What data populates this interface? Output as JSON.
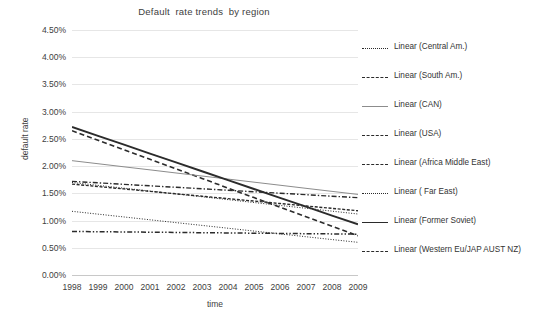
{
  "chart_data": {
    "type": "line",
    "title": "Default  rate trends  by region",
    "xlabel": "time",
    "ylabel": "default rate",
    "grid": true,
    "legend_position": "right",
    "x": [
      1998,
      1999,
      2000,
      2001,
      2002,
      2003,
      2004,
      2005,
      2006,
      2007,
      2008,
      2009
    ],
    "categories": [
      "1998",
      "1999",
      "2000",
      "2001",
      "2002",
      "2003",
      "2004",
      "2005",
      "2006",
      "2007",
      "2008",
      "2009"
    ],
    "ylim": [
      0.0,
      4.5
    ],
    "ytick_values": [
      0.0,
      0.5,
      1.0,
      1.5,
      2.0,
      2.5,
      3.0,
      3.5,
      4.0,
      4.5
    ],
    "ytick_labels": [
      "0.00%",
      "0.50%",
      "1.00%",
      "1.50%",
      "2.00%",
      "2.50%",
      "3.00%",
      "3.50%",
      "4.00%",
      "4.50%"
    ],
    "series": [
      {
        "name": "Linear (Central Am.)",
        "region": "Central Am.",
        "dash": "fine-dotted",
        "width": 1,
        "start": 1.7,
        "end": 1.12,
        "values": [
          1.7,
          1.647,
          1.595,
          1.542,
          1.489,
          1.437,
          1.384,
          1.331,
          1.278,
          1.226,
          1.173,
          1.12
        ]
      },
      {
        "name": "Linear (South Am.)",
        "region": "South Am.",
        "dash": "long-dash",
        "width": 1.6,
        "start": 2.65,
        "end": 0.72,
        "values": [
          2.65,
          2.475,
          2.299,
          2.124,
          1.948,
          1.773,
          1.597,
          1.422,
          1.246,
          1.071,
          0.895,
          0.72
        ]
      },
      {
        "name": "Linear (CAN)",
        "region": "CAN",
        "dash": "light-solid",
        "width": 1,
        "start": 2.1,
        "end": 1.48,
        "values": [
          2.1,
          2.044,
          1.987,
          1.931,
          1.874,
          1.818,
          1.762,
          1.705,
          1.649,
          1.592,
          1.536,
          1.48
        ]
      },
      {
        "name": "Linear (USA)",
        "region": "USA",
        "dash": "dash-dot",
        "width": 1.4,
        "start": 1.72,
        "end": 1.42,
        "values": [
          1.72,
          1.693,
          1.665,
          1.638,
          1.611,
          1.584,
          1.556,
          1.529,
          1.502,
          1.475,
          1.447,
          1.42
        ]
      },
      {
        "name": "Linear (Africa Middle East)",
        "region": "Africa Middle East",
        "dash": "dense-dash",
        "width": 1.4,
        "start": 1.67,
        "end": 1.18,
        "values": [
          1.67,
          1.625,
          1.581,
          1.536,
          1.491,
          1.447,
          1.402,
          1.358,
          1.313,
          1.268,
          1.224,
          1.18
        ]
      },
      {
        "name": "Linear ( Far East)",
        "region": " Far East",
        "dash": "fine-dotted",
        "width": 1,
        "start": 1.17,
        "end": 0.6,
        "values": [
          1.17,
          1.118,
          1.066,
          1.014,
          0.962,
          0.911,
          0.859,
          0.807,
          0.755,
          0.703,
          0.651,
          0.6
        ]
      },
      {
        "name": "Linear (Former Soviet)",
        "region": "Former Soviet",
        "dash": "solid",
        "width": 1.9,
        "start": 2.72,
        "end": 0.93,
        "values": [
          2.72,
          2.557,
          2.394,
          2.231,
          2.069,
          1.906,
          1.743,
          1.58,
          1.418,
          1.255,
          1.092,
          0.93
        ]
      },
      {
        "name": "Linear (Western Eu/JAP AUST NZ)",
        "region": "Western Eu/JAP AUST NZ",
        "dash": "dash-dot-dot",
        "width": 1.5,
        "start": 0.8,
        "end": 0.75,
        "values": [
          0.8,
          0.795,
          0.791,
          0.786,
          0.782,
          0.777,
          0.773,
          0.768,
          0.764,
          0.759,
          0.755,
          0.75
        ]
      }
    ],
    "colors": {
      "line": "#2b2b2b",
      "light_line": "#8c8c8c",
      "grid": "#e6e6e6",
      "axis": "#c8c8c8",
      "text": "#404040",
      "background": "#ffffff"
    }
  }
}
